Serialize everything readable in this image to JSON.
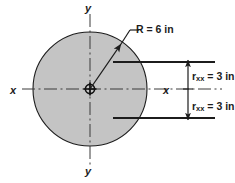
{
  "figure": {
    "shape": "circle",
    "fill_color": "#c4c4c4",
    "outline_color": "#1c1c1c",
    "background_color": "#ffffff",
    "labels": {
      "y_axis_top": "y",
      "y_axis_bottom": "y",
      "x_axis_left": "x",
      "x_axis_right": "x",
      "radius_prefix": "R = ",
      "radius_value": "6",
      "radius_unit": " in",
      "radius_full": "R = 6 in",
      "rxx_top_symbol": "r",
      "rxx_top_subscript": "xx",
      "rxx_top_rest": " = 3 in",
      "rxx_top_full": "rₓₓ = 3 in",
      "rxx_bottom_symbol": "r",
      "rxx_bottom_subscript": "xx",
      "rxx_bottom_rest": " = 3 in",
      "rxx_bottom_full": "rₓₓ = 3 in"
    },
    "geometry": {
      "center_x": 90,
      "center_y": 89,
      "radius_px": 57,
      "dimension_line_x": 188,
      "upper_extension_y": 62,
      "lower_extension_y": 118
    },
    "values": {
      "radius_in": 6,
      "rxx_in": 3
    }
  }
}
